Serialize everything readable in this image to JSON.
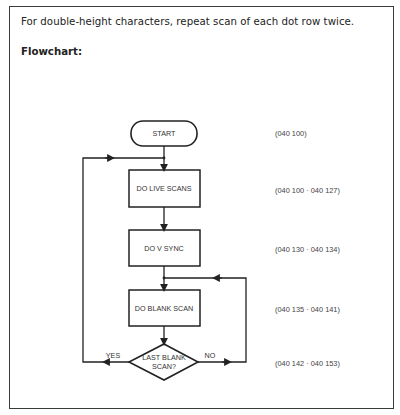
{
  "document": {
    "intro_text": "For double-height characters, repeat scan of each dot row twice.",
    "heading": "Flowchart:"
  },
  "flowchart": {
    "nodes": [
      {
        "id": "start",
        "type": "terminal",
        "label": "START",
        "address": "(040 100)"
      },
      {
        "id": "live",
        "type": "process",
        "label": "DO LIVE SCANS",
        "address": "(040 100 · 040 127)"
      },
      {
        "id": "vsync",
        "type": "process",
        "label": "DO V SYNC",
        "address": "(040 130 · 040 134)"
      },
      {
        "id": "blank",
        "type": "process",
        "label": "DO BLANK SCAN",
        "address": "(040 135 · 040 141)"
      },
      {
        "id": "decision",
        "type": "decision",
        "label_line1": "LAST BLANK",
        "label_line2": "SCAN?",
        "address": "(040 142 · 040 153)"
      }
    ],
    "edges": {
      "yes_label": "YES",
      "no_label": "NO"
    }
  }
}
